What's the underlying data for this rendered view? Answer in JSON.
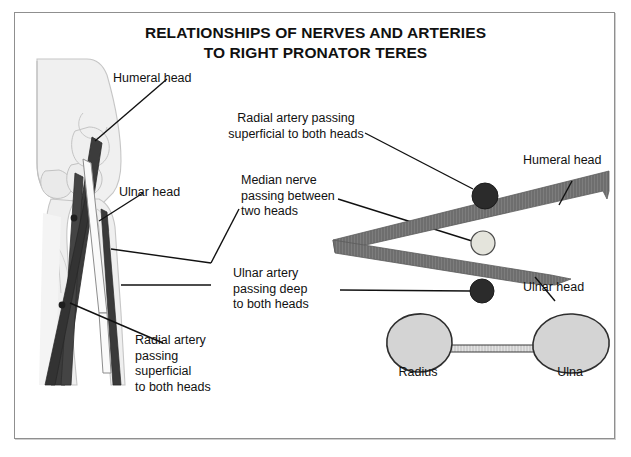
{
  "figure": {
    "title_line_1": "RELATIONSHIPS OF NERVES AND ARTERIES",
    "title_line_2": "TO RIGHT PRONATOR TERES",
    "border_color": "#8f8f8f",
    "background_color": "#ffffff"
  },
  "left_panel": {
    "description": "Anterior view of right elbow showing pronator teres heads and vessels over humerus, radius and ulna",
    "labels": {
      "humeral_head": "Humeral head",
      "ulnar_head": "Ulnar head",
      "radial_artery": "Radial artery\npassing\nsuperficial\nto both heads"
    }
  },
  "center_labels": {
    "radial_artery": "Radial artery passing\nsuperficial to both heads",
    "median_nerve": "Median nerve\npassing between\ntwo heads",
    "ulnar_artery": "Ulnar artery\npassing deep\nto both heads"
  },
  "right_panel": {
    "description": "Cross-sectional schematic of pronator teres heads with vessels and forearm bones",
    "labels": {
      "humeral_head": "Humeral head",
      "ulnar_head": "Ulnar head",
      "radius": "Radius",
      "ulna": "Ulna"
    },
    "structures": [
      {
        "name": "radial-artery",
        "type": "circle",
        "fill": "#2b2b2b",
        "cx": 470,
        "cy": 183,
        "r": 13
      },
      {
        "name": "median-nerve",
        "type": "circle",
        "fill": "#e4e4dc",
        "cx": 468,
        "cy": 230,
        "r": 12
      },
      {
        "name": "ulnar-artery",
        "type": "circle",
        "fill": "#2b2b2b",
        "cx": 467,
        "cy": 278,
        "r": 12
      },
      {
        "name": "humeral-head-band",
        "type": "band",
        "fill": "#6e6e6e"
      },
      {
        "name": "ulnar-head-band",
        "type": "band",
        "fill": "#6e6e6e"
      },
      {
        "name": "radius-bone",
        "type": "bone",
        "fill": "#d4d4d4"
      },
      {
        "name": "ulna-bone",
        "type": "bone",
        "fill": "#d4d4d4"
      }
    ]
  },
  "colors": {
    "muscle_band": "#6e6e6e",
    "artery_dark": "#2b2b2b",
    "nerve_light": "#e4e4dc",
    "bone_fill": "#d4d4d4",
    "bone_outline": "#3a3a3a",
    "bone_pale": "#ededed",
    "leader_line": "#111111",
    "text": "#111111"
  }
}
